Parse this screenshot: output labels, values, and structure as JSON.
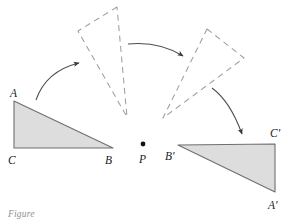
{
  "figure": {
    "caption": "Figure",
    "colors": {
      "solid_outline": "#6b6b6b",
      "solid_fill": "#dcdcdc",
      "dashed_outline": "#9a9a9a",
      "arrow": "#4a4a4a",
      "label_text": "#1a1a1a",
      "caption_text": "#8e8e8e",
      "background": "#ffffff"
    },
    "labels": {
      "a": "A",
      "b": "B",
      "c": "C",
      "p": "P",
      "a_prime": "A'",
      "b_prime": "B'",
      "c_prime": "C'"
    },
    "shapes": {
      "original_triangle": {
        "style": "solid-filled",
        "points": "14,101 14,148 113,148",
        "vertices": [
          {
            "name": "A",
            "x": 14,
            "y": 101
          },
          {
            "name": "C",
            "x": 14,
            "y": 148
          },
          {
            "name": "B",
            "x": 113,
            "y": 148
          }
        ]
      },
      "intermediate_triangle_left": {
        "style": "dashed",
        "points": "117,7 78,31 127,117",
        "vertices": [
          {
            "x": 117,
            "y": 7
          },
          {
            "x": 78,
            "y": 31
          },
          {
            "x": 127,
            "y": 117
          }
        ]
      },
      "intermediate_triangle_right": {
        "style": "dashed",
        "points": "207,29 244,58 163,118",
        "vertices": [
          {
            "x": 207,
            "y": 29
          },
          {
            "x": 244,
            "y": 58
          },
          {
            "x": 163,
            "y": 118
          }
        ]
      },
      "image_triangle": {
        "style": "solid-filled",
        "points": "178,145 275,144 275,192",
        "vertices": [
          {
            "name": "B'",
            "x": 178,
            "y": 145
          },
          {
            "name": "C'",
            "x": 275,
            "y": 144
          },
          {
            "name": "A'",
            "x": 275,
            "y": 192
          }
        ]
      },
      "center_point": {
        "name": "P",
        "x": 143,
        "y": 144,
        "radius": 2.4
      }
    },
    "arrows": [
      {
        "name": "arrow-1",
        "from_x": 36,
        "from_y": 100,
        "to_x": 81,
        "to_y": 62,
        "ctrl_x": 46,
        "ctrl_y": 71
      },
      {
        "name": "arrow-2",
        "from_x": 128,
        "from_y": 44,
        "to_x": 185,
        "to_y": 58,
        "ctrl_x": 158,
        "ctrl_y": 41
      },
      {
        "name": "arrow-3",
        "from_x": 212,
        "from_y": 88,
        "to_x": 243,
        "to_y": 137,
        "ctrl_x": 229,
        "ctrl_y": 100
      }
    ],
    "label_positions": {
      "a": {
        "x": 10,
        "y": 97
      },
      "c": {
        "x": 8,
        "y": 164
      },
      "b": {
        "x": 106,
        "y": 164
      },
      "p": {
        "x": 139,
        "y": 163
      },
      "b_prime": {
        "x": 166,
        "y": 160
      },
      "c_prime": {
        "x": 271,
        "y": 137
      },
      "a_prime": {
        "x": 269,
        "y": 208
      }
    }
  }
}
